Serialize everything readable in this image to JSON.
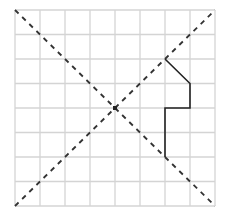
{
  "diagram": {
    "type": "grid-symmetry-figure",
    "grid": {
      "columns": 8,
      "rows": 8,
      "left": 15,
      "top": 10,
      "cell_width": 25,
      "cell_height": 24.5,
      "line_color": "#d4d4d4"
    },
    "axes_of_symmetry": [
      {
        "name": "diagonal-top-left-to-bottom-right",
        "from": [
          0,
          0
        ],
        "to": [
          8,
          8
        ],
        "style": "dashed",
        "color": "#333333"
      },
      {
        "name": "diagonal-bottom-left-to-top-right",
        "from": [
          0,
          8
        ],
        "to": [
          8,
          0
        ],
        "style": "dashed",
        "color": "#333333"
      }
    ],
    "center_point": {
      "at": [
        4,
        4
      ],
      "color": "#222222"
    },
    "polyline": {
      "points": [
        [
          6,
          2
        ],
        [
          7,
          3
        ],
        [
          7,
          4
        ],
        [
          6,
          4
        ],
        [
          6,
          6
        ]
      ],
      "color": "#222222",
      "width": 1.6
    }
  }
}
